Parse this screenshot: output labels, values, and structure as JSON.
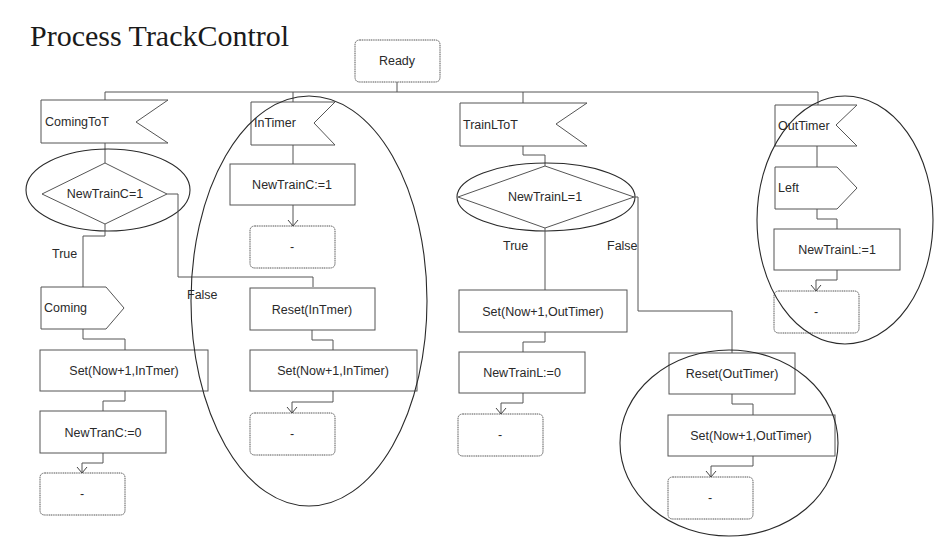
{
  "title": "Process TrackControl",
  "start_state": "Ready",
  "colors": {
    "stroke": "#555555",
    "text": "#2a2a2a",
    "background": "#ffffff"
  },
  "branches": [
    {
      "input": "ComingToT",
      "decision": "NewTrainC=1",
      "true_label": "True",
      "false_label": "False",
      "true_path": {
        "output": "Coming",
        "tasks": [
          "Set(Now+1,InTmer)",
          "NewTranC:=0"
        ],
        "next_state": "-"
      }
    },
    {
      "input": "InTimer",
      "tasks": [
        "NewTrainC:=1"
      ],
      "next_state": "-",
      "false_path_of_branch_0": {
        "tasks": [
          "Reset(InTmer)",
          "Set(Now+1,InTimer)"
        ],
        "next_state": "-"
      }
    },
    {
      "input": "TrainLToT",
      "decision": "NewTrainL=1",
      "true_label": "True",
      "false_label": "False",
      "true_path": {
        "tasks": [
          "Set(Now+1,OutTimer)",
          "NewTrainL:=0"
        ],
        "next_state": "-"
      },
      "false_path": {
        "tasks": [
          "Reset(OutTimer)",
          "Set(Now+1,OutTimer)"
        ],
        "next_state": "-"
      }
    },
    {
      "input": "OutTimer",
      "output": "Left",
      "tasks": [
        "NewTrainL:=1"
      ],
      "next_state": "-"
    }
  ]
}
